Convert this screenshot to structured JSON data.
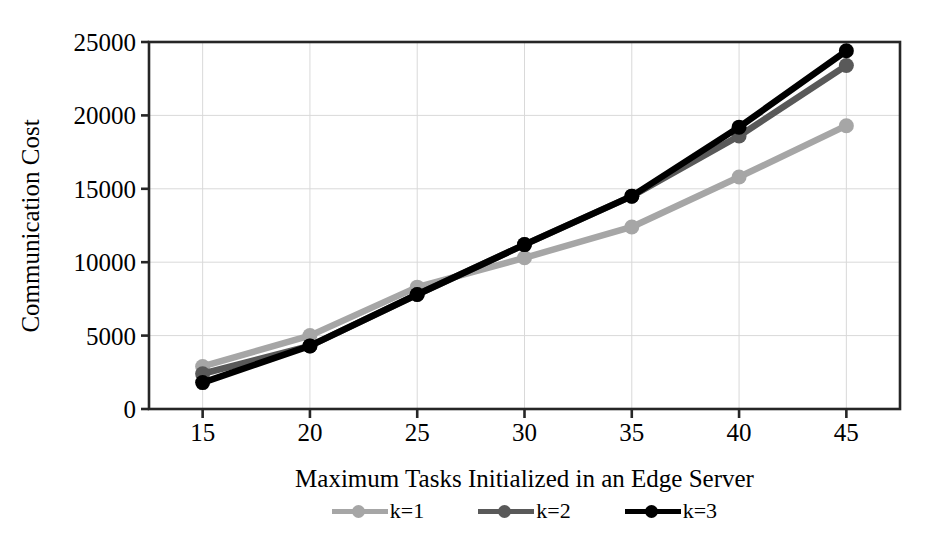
{
  "chart_data": {
    "type": "line",
    "title": "",
    "xlabel": "Maximum Tasks Initialized in an Edge Server",
    "ylabel": "Communication Cost",
    "x": [
      15,
      20,
      25,
      30,
      35,
      40,
      45
    ],
    "xtick_labels": [
      "15",
      "20",
      "25",
      "30",
      "35",
      "40",
      "45"
    ],
    "ytick_labels": [
      "0",
      "5000",
      "10000",
      "15000",
      "20000",
      "25000"
    ],
    "yticks": [
      0,
      5000,
      10000,
      15000,
      20000,
      25000
    ],
    "xlim": [
      12.5,
      47.5
    ],
    "ylim": [
      0,
      25000
    ],
    "grid": "horizontal-and-vertical",
    "legend_position": "below-axis",
    "series": [
      {
        "name": "k=1",
        "color": "#A6A6A6",
        "values": [
          2900,
          5000,
          8300,
          10300,
          12400,
          15800,
          19300
        ]
      },
      {
        "name": "k=2",
        "color": "#595959",
        "values": [
          2400,
          4300,
          7800,
          11200,
          14500,
          18600,
          23400
        ]
      },
      {
        "name": "k=3",
        "color": "#000000",
        "values": [
          1800,
          4300,
          7800,
          11200,
          14500,
          19200,
          24400
        ]
      }
    ]
  },
  "axes": {
    "frame_color": "#262626",
    "gridline_color": "#D9D9D9",
    "background": "#FFFFFF"
  }
}
